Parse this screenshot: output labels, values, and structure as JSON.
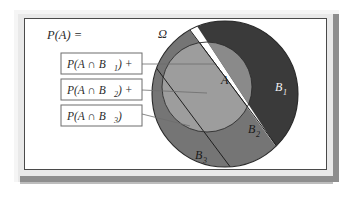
{
  "figure": {
    "title_expression": "P(A) =",
    "universe_label": "Ω",
    "set_a_label": "A"
  },
  "terms": [
    {
      "id": "term-1",
      "text": "P(A ∩ B",
      "subscript": "1",
      "suffix": ") +"
    },
    {
      "id": "term-2",
      "text": "P(A ∩ B",
      "subscript": "2",
      "suffix": ") +"
    },
    {
      "id": "term-3",
      "text": "P(A ∩ B",
      "subscript": "3",
      "suffix": ")"
    }
  ],
  "regions": [
    {
      "id": "region-b1",
      "base": "B",
      "subscript": "1",
      "color": "#3a3a3a",
      "inside_a_color": "#8a8a8a"
    },
    {
      "id": "region-b2",
      "base": "B",
      "subscript": "2",
      "color": "#757575",
      "inside_a_color": "#9d9d9d"
    },
    {
      "id": "region-b3",
      "base": "B",
      "subscript": "3",
      "color": "#b8b8b8",
      "inside_a_color": "#cfcfcf"
    }
  ],
  "colors": {
    "frame": "#e9e9e9",
    "frame_shadow": "#8e8e8e",
    "panel_background": "#ffffff",
    "panel_border": "#4a4a4a",
    "box_border": "#6d6d6d",
    "connector": "#6d6d6d",
    "outline": "#2a2a2a",
    "text": "#2b2b2b"
  }
}
